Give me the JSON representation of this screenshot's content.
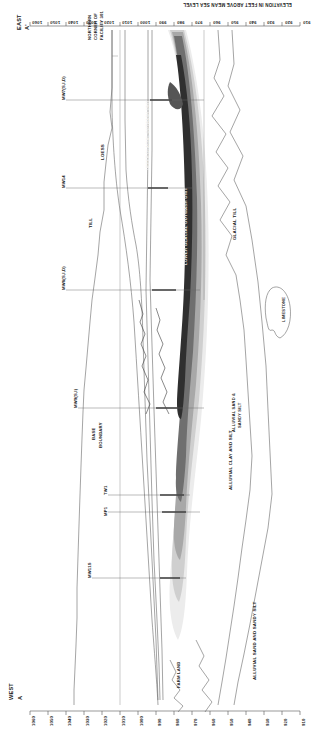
{
  "figure": {
    "type": "geologic-cross-section",
    "orientation": "rotated-90",
    "west_end_label": "WEST",
    "west_end_id": "A",
    "east_end_label": "EAST",
    "east_end_id": "A'",
    "axis_title": "ELEVATION IN FEET ABOVE MEAN SEA LEVEL",
    "axis_ticks_top": [
      "1060",
      "1050",
      "1040",
      "1030",
      "1020",
      "1010",
      "1000",
      "990",
      "980",
      "970",
      "960",
      "950",
      "940",
      "930",
      "920",
      "910"
    ],
    "axis_ticks_bottom": [
      "1060",
      "1050",
      "1040",
      "1030",
      "1020",
      "1010",
      "1000",
      "990",
      "980",
      "970",
      "960",
      "950",
      "940",
      "930",
      "920",
      "910"
    ],
    "axis_min": 910,
    "axis_max": 1060,
    "axis_step": 10,
    "site_note_lines": [
      "NORTHERN",
      "CORNER OF",
      "FACILITY 301"
    ],
    "land_use_label": "FARM LAND",
    "base_boundary_lines": [
      "BASE",
      "BOUNDARY"
    ]
  },
  "geologic_units": [
    {
      "name": "LOESS",
      "label": "LOESS"
    },
    {
      "name": "TILL",
      "label": "TILL"
    },
    {
      "name": "GLACIAL TILL",
      "label": "GLACIAL TILL"
    },
    {
      "name": "UPPER GLACIAL OUTWASH UNIT",
      "label": "UPPER GLACIAL OUTWASH UNIT"
    },
    {
      "name": "LOWER GLACIAL OUTWASH UNIT",
      "label": "LOWER GLACIAL OUTWASH UNIT"
    },
    {
      "name": "ALLUVIAL CLAY AND SILT",
      "label": "ALLUVIAL CLAY AND SILT"
    },
    {
      "name": "ALLUVIAL SAND & SANDY SILT",
      "label": "ALLUVIAL SAND &\nSANDY SILT"
    },
    {
      "name": "ALLUVIAL SAND AND SANDY SILT",
      "label": "ALLUVIAL SAND AND SANDY SILT"
    },
    {
      "name": "LIMESTONE",
      "label": "LIMESTONE"
    }
  ],
  "unit_labels": {
    "loess": "LOESS",
    "till": "TILL",
    "glacial_till": "GLACIAL TILL",
    "upper_outwash": "UPPER GLACIAL OUTWASH UNIT",
    "lower_outwash": "LOWER GLACIAL OUTWASH UNIT",
    "alluvial_clay_silt": "ALLUVIAL CLAY AND SILT",
    "alluvial_sand_silt_a": "ALLUVIAL SAND &",
    "alluvial_sand_silt_b": "SANDY SILT",
    "alluvial_sand_sandy_silt": "ALLUVIAL SAND AND SANDY SILT",
    "limestone": "LIMESTONE"
  },
  "wells": [
    {
      "id": "MW7(S,I,D)",
      "label": "MW7(S,I,D)"
    },
    {
      "id": "MW14",
      "label": "MW14"
    },
    {
      "id": "MW8(S,I,D)",
      "label": "MW8(S,I,D)"
    },
    {
      "id": "MW9(S,I)",
      "label": "MW9(S,I)"
    },
    {
      "id": "TW1",
      "label": "TW1"
    },
    {
      "id": "MP1",
      "label": "MP1"
    },
    {
      "id": "MW11S",
      "label": "MW11S"
    }
  ],
  "colors": {
    "plume_outer": "#e8e8e8",
    "plume_mid": "#c9c9c9",
    "plume_inner": "#9d9d9d",
    "plume_core": "#6e6e6e",
    "plume_core2": "#3c3c3c",
    "line": "#5a5a5a",
    "text": "#1a1a1a",
    "background": "#ffffff"
  }
}
